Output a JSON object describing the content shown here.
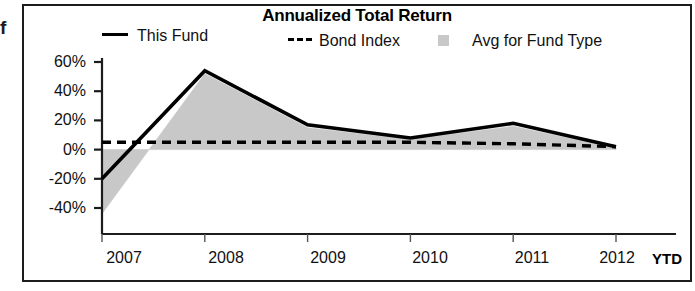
{
  "edge_text": "f",
  "chart": {
    "title": "Annualized Total Return",
    "legend": [
      {
        "label": "This Fund",
        "marker": "solid-line",
        "color": "#000000"
      },
      {
        "label": "Bond Index",
        "marker": "dashed-line",
        "color": "#000000"
      },
      {
        "label": "Avg for Fund Type",
        "marker": "filled-square",
        "color": "#c8c8c8"
      }
    ],
    "y_ticks": [
      "60%",
      "40%",
      "20%",
      "0%",
      "-20%",
      "-40%"
    ],
    "x_ticks": [
      "2007",
      "2008",
      "2009",
      "2010",
      "2011",
      "2012"
    ],
    "x_suffix": "YTD"
  },
  "chart_data": {
    "type": "line",
    "title": "Annualized Total Return",
    "xlabel": "",
    "ylabel": "",
    "x": [
      "2007",
      "2008",
      "2009",
      "2010",
      "2011",
      "2012"
    ],
    "categories": [
      "2007",
      "2008",
      "2009",
      "2010",
      "2011",
      "2012"
    ],
    "ylim": [
      -40,
      60
    ],
    "ytick_values": [
      60,
      40,
      20,
      0,
      -20,
      -40
    ],
    "ytick_labels": [
      "60%",
      "40%",
      "20%",
      "0%",
      "-20%",
      "-40%"
    ],
    "grid": false,
    "legend_position": "top",
    "x_axis_note": "YTD",
    "series": [
      {
        "name": "This Fund",
        "style": "solid-line",
        "color": "#000000",
        "values": [
          -20,
          54,
          17,
          8,
          18,
          2
        ]
      },
      {
        "name": "Bond Index",
        "style": "dashed-line",
        "color": "#000000",
        "values": [
          5,
          5,
          5,
          5,
          4,
          2
        ]
      },
      {
        "name": "Avg for Fund Type",
        "style": "filled-area",
        "color": "#c8c8c8",
        "values": [
          -44,
          52,
          15,
          7,
          16,
          1
        ]
      }
    ]
  }
}
